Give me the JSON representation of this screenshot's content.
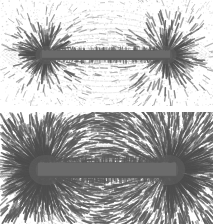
{
  "figure": {
    "title": "Iron filings magnetic field patterns around bar magnets",
    "description": "Two stacked photographs of iron filings sprinkled on paper over a bar magnet, revealing the magnetic field.",
    "background_color": "#ffffff",
    "width": 213,
    "height": 224
  },
  "panels": [
    {
      "id": "panel-top",
      "name": "weak-field-panel",
      "label": "Top photograph — sparse iron filing field pattern",
      "magnet": {
        "name": "bar-magnet",
        "color": "#6b6b6b",
        "x": 42,
        "y": 50,
        "width": 128,
        "height": 10,
        "orientation": "horizontal"
      },
      "poles": [
        {
          "name": "left-pole",
          "x": 46,
          "y": 55,
          "burst_radius": 16
        },
        {
          "name": "right-pole",
          "x": 166,
          "y": 55,
          "burst_radius": 16
        }
      ],
      "field": {
        "density": "sparse",
        "filing_color": "#777777",
        "speck_count": 1500,
        "streak_count": 620,
        "arc_count": 26,
        "arc_opacity": 0.3
      }
    },
    {
      "id": "panel-bottom",
      "name": "strong-field-panel",
      "label": "Bottom photograph — dense iron filing field lines",
      "magnet": {
        "name": "bar-magnet",
        "color": "#6b6b6b",
        "x": 38,
        "y": 50,
        "width": 138,
        "height": 16,
        "orientation": "horizontal"
      },
      "poles": [
        {
          "name": "left-pole",
          "x": 46,
          "y": 58,
          "burst_radius": 26
        },
        {
          "name": "right-pole",
          "x": 168,
          "y": 58,
          "burst_radius": 26
        }
      ],
      "field": {
        "density": "dense",
        "filing_color": "#5f5f5f",
        "speck_count": 900,
        "streak_count": 2100,
        "arc_count": 64,
        "arc_opacity": 0.55
      }
    }
  ],
  "colors": {
    "paper": "#ffffff",
    "magnet_body": "#6b6b6b",
    "magnet_shadow": "#4a4a4a",
    "filings_light": "#9a9a9a",
    "filings_mid": "#7a7a7a",
    "filings_dark": "#4f4f4f"
  }
}
